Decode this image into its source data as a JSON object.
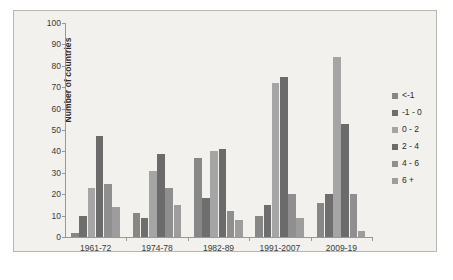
{
  "chart_data": {
    "type": "bar",
    "title": "",
    "xlabel": "",
    "ylabel": "Number of countries",
    "ylim": [
      0,
      100
    ],
    "ytick_step": 10,
    "yticks": [
      100,
      90,
      80,
      70,
      60,
      50,
      40,
      30,
      20,
      10,
      0
    ],
    "grid": false,
    "legend_position": "right",
    "categories": [
      "1961-72",
      "1974-78",
      "1982-89",
      "1991-2007",
      "2009-19"
    ],
    "series": [
      {
        "name": "<-1",
        "color": "#878787",
        "values": [
          2,
          11,
          37,
          10,
          16
        ]
      },
      {
        "name": "-1 - 0",
        "color": "#6e6e6e",
        "values": [
          10,
          9,
          18,
          15,
          20
        ]
      },
      {
        "name": "0 - 2",
        "color": "#a5a5a5",
        "values": [
          23,
          31,
          40,
          72,
          84
        ]
      },
      {
        "name": "2 - 4",
        "color": "#6b6b6b",
        "values": [
          47,
          39,
          41,
          75,
          53
        ]
      },
      {
        "name": "4 - 6",
        "color": "#8f8f8f",
        "values": [
          25,
          23,
          12,
          20,
          20
        ]
      },
      {
        "name": "6 +",
        "color": "#9d9d9d",
        "values": [
          14,
          15,
          8,
          9,
          3
        ]
      }
    ]
  }
}
